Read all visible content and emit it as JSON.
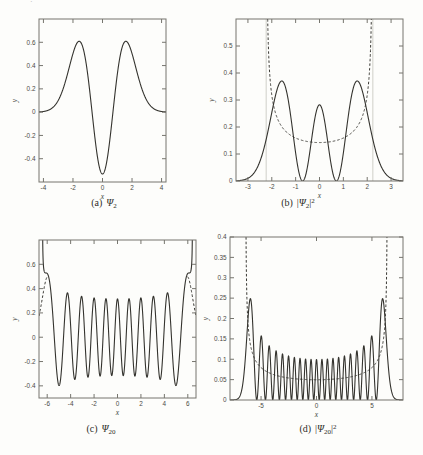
{
  "style": {
    "background": "#fdfdfb",
    "solid_color": "#34332e",
    "dashed_color": "#3a3934",
    "frame_color": "#76756e",
    "tick_label_color": "#4a4944",
    "axis_label_color": "#403f39",
    "caption_color": "#2e2d28",
    "guide_color": "#cfcfc8",
    "dash_pattern": "2.6,2",
    "tick_length": 4
  },
  "artifact": {
    "top_left_cropped_text": "·"
  },
  "chart_data": [
    {
      "id": "a",
      "type": "line",
      "caption": {
        "index": "(a)",
        "pre": "",
        "base": "Ψ",
        "sub": "2",
        "post": "",
        "sup": ""
      },
      "xlabel": "x",
      "ylabel": "y",
      "xlim": [
        -4.3,
        4.3
      ],
      "ylim": [
        -0.6,
        0.8
      ],
      "xticks": [
        -4,
        -2,
        0,
        2,
        4
      ],
      "yticks": [
        -0.4,
        -0.2,
        0,
        0.2,
        0.4,
        0.6
      ],
      "frame": {
        "left": 39,
        "top": 19,
        "right": 166,
        "bottom": 182
      },
      "series": [
        {
          "id": "psi2-wavefunction",
          "label": "harmonic oscillator eigenfunction n=2",
          "style": "solid",
          "generator": {
            "kind": "ho_exact",
            "n": 2,
            "x_from": -4.3,
            "x_to": 4.3,
            "step": 0.01
          },
          "key_points": [
            [
              -1.58,
              0.61
            ],
            [
              -0.71,
              0
            ],
            [
              0,
              -0.53
            ],
            [
              0.71,
              0
            ],
            [
              1.58,
              0.61
            ]
          ]
        }
      ]
    },
    {
      "id": "b",
      "type": "line",
      "caption": {
        "index": "(b)",
        "pre": "|",
        "base": "Ψ",
        "sub": "2",
        "post": "|",
        "sup": "2"
      },
      "xlabel": "x",
      "ylabel": "y",
      "xlim": [
        -3.5,
        3.5
      ],
      "ylim": [
        0,
        0.6
      ],
      "xticks": [
        -3,
        -2,
        -1,
        0,
        1,
        2,
        3
      ],
      "yticks": [
        0,
        0.1,
        0.2,
        0.3,
        0.4,
        0.5
      ],
      "frame": {
        "left": 236,
        "top": 19,
        "right": 403,
        "bottom": 181
      },
      "guides": {
        "vlines": [
          -2.236,
          2.236
        ],
        "meaning": "classical turning points"
      },
      "series": [
        {
          "id": "psi2-probability-density",
          "label": "quantum probability density n=2",
          "style": "solid",
          "generator": {
            "kind": "ho_exact_sq",
            "n": 2,
            "x_from": -3.5,
            "x_to": 3.5,
            "step": 0.01
          },
          "key_points": [
            [
              -1.58,
              0.37
            ],
            [
              -0.71,
              0
            ],
            [
              0,
              0.28
            ],
            [
              0.71,
              0
            ],
            [
              1.58,
              0.37
            ]
          ]
        },
        {
          "id": "classical-density-E2p5",
          "label": "classical probability density E=2.5",
          "style": "dashed",
          "generator": {
            "kind": "classical",
            "E": 2.5,
            "x_from": -2.235,
            "x_to": 2.235,
            "step": 0.004
          },
          "key_points": [
            [
              -2.17,
              0.6
            ],
            [
              0,
              0.14
            ],
            [
              2.17,
              0.6
            ]
          ]
        }
      ]
    },
    {
      "id": "c",
      "type": "line",
      "caption": {
        "index": "(c)",
        "pre": "",
        "base": "Ψ",
        "sub": "20",
        "post": "",
        "sup": ""
      },
      "xlabel": "x",
      "ylabel": "y",
      "xlim": [
        -6.7,
        6.7
      ],
      "ylim": [
        -0.5,
        0.8
      ],
      "xticks": [
        -6,
        -4,
        -2,
        0,
        2,
        4,
        6
      ],
      "yticks": [
        -0.4,
        -0.2,
        0,
        0.2,
        0.4,
        0.6
      ],
      "frame": {
        "left": 39,
        "top": 240,
        "right": 196,
        "bottom": 398
      },
      "series": [
        {
          "id": "psi20-exact-edge-tail",
          "label": "exact eigenfunction n=20 near turning points",
          "style": "dashed",
          "generator": {
            "kind": "ho_exact_tail",
            "n": 20,
            "abs_from": 5.98,
            "abs_to": 6.7,
            "step": 0.02
          },
          "key_points": [
            [
              -6.4,
              0.33
            ],
            [
              6.4,
              0.33
            ]
          ]
        },
        {
          "id": "psi20-wavefunction",
          "label": "oscillating wavefunction n=20, diverging at turning points ±6.40",
          "style": "solid",
          "generator": {
            "kind": "ho_wkb",
            "E": 20.5,
            "x_from": -6.401,
            "x_to": 6.401,
            "step": 0.006
          },
          "key_points": [
            [
              0,
              0.32
            ],
            [
              -5.0,
              -0.4
            ],
            [
              5.0,
              -0.4
            ],
            [
              -5.95,
              0.52
            ],
            [
              5.95,
              0.52
            ]
          ]
        }
      ]
    },
    {
      "id": "d",
      "type": "line",
      "caption": {
        "index": "(d)",
        "pre": "|",
        "base": "Ψ",
        "sub": "20",
        "post": "|",
        "sup": "2"
      },
      "xlabel": "x",
      "ylabel": "y",
      "xlim": [
        -7.8,
        7.8
      ],
      "ylim": [
        0,
        0.4
      ],
      "xticks": [
        -5,
        0,
        5
      ],
      "yticks": [
        0,
        0.05,
        0.1,
        0.15,
        0.2,
        0.25,
        0.3,
        0.35,
        0.4
      ],
      "frame": {
        "left": 230,
        "top": 237,
        "right": 403,
        "bottom": 400
      },
      "series": [
        {
          "id": "psi20-probability-density",
          "label": "quantum probability density n=20 (21 peaks)",
          "style": "solid",
          "generator": {
            "kind": "ho_exact_sq",
            "n": 20,
            "x_from": -7.8,
            "x_to": 7.8,
            "step": 0.008
          },
          "key_points": [
            [
              -5.95,
              0.25
            ],
            [
              0,
              0.1
            ],
            [
              5.95,
              0.25
            ]
          ]
        },
        {
          "id": "classical-density-E20p5",
          "label": "classical probability density E=20.5",
          "style": "dashed",
          "generator": {
            "kind": "classical",
            "E": 20.5,
            "x_from": -6.402,
            "x_to": 6.402,
            "step": 0.008
          },
          "key_points": [
            [
              -6.35,
              0.4
            ],
            [
              0,
              0.05
            ],
            [
              6.35,
              0.4
            ]
          ]
        }
      ]
    }
  ]
}
